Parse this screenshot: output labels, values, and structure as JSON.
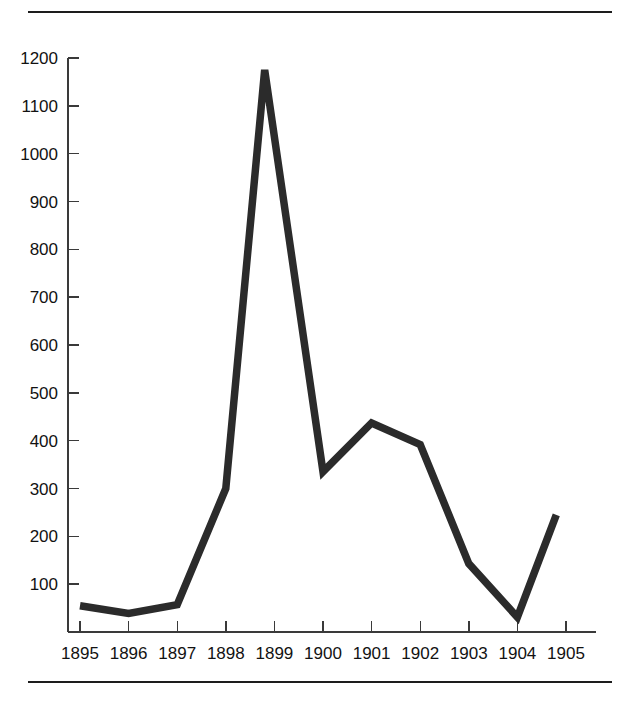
{
  "page": {
    "background_color": "#ffffff",
    "rule_color": "#1d1d1d",
    "top_rule": "horizontal-rule",
    "bottom_rule": "horizontal-rule"
  },
  "chart_data": {
    "type": "line",
    "title": "",
    "subtitle": "",
    "xlabel": "",
    "ylabel": "",
    "categories": [
      "1895",
      "1896",
      "1897",
      "1898",
      "1899",
      "1900",
      "1901",
      "1902",
      "1903",
      "1904",
      "1905"
    ],
    "x": [
      1895,
      1896,
      1897,
      1898,
      1898.8,
      1900,
      1901,
      1902,
      1903,
      1904,
      1904.8
    ],
    "values": [
      55,
      39,
      57,
      300,
      1175,
      335,
      437,
      392,
      143,
      31,
      245
    ],
    "series": [
      {
        "name": "series-1",
        "color": "#2b2b2b",
        "points": [
          {
            "x": 1895,
            "label": "1895",
            "y": 55
          },
          {
            "x": 1896,
            "label": "1896",
            "y": 39
          },
          {
            "x": 1897,
            "label": "1897",
            "y": 57
          },
          {
            "x": 1898,
            "label": "1898",
            "y": 300
          },
          {
            "x": 1898.8,
            "label": "peak",
            "y": 1175
          },
          {
            "x": 1900,
            "label": "1900",
            "y": 335
          },
          {
            "x": 1901,
            "label": "1901",
            "y": 437
          },
          {
            "x": 1902,
            "label": "1902",
            "y": 392
          },
          {
            "x": 1903,
            "label": "1903",
            "y": 143
          },
          {
            "x": 1904,
            "label": "1904",
            "y": 31
          },
          {
            "x": 1904.8,
            "label": "end",
            "y": 245
          }
        ]
      }
    ],
    "xlim": [
      1895,
      1905
    ],
    "ylim": [
      0,
      1200
    ],
    "ytick_values": [
      100,
      200,
      300,
      400,
      500,
      600,
      700,
      800,
      900,
      1000,
      1100,
      1200
    ],
    "ytick_labels": [
      "100",
      "200",
      "300",
      "400",
      "500",
      "600",
      "700",
      "800",
      "900",
      "1000",
      "1100",
      "1200"
    ],
    "xtick_labels": [
      "1895",
      "1896",
      "1897",
      "1898",
      "1899",
      "1900",
      "1901",
      "1902",
      "1903",
      "1904",
      "1905"
    ],
    "grid": false,
    "legend": false,
    "legend_position": "none",
    "annotations": []
  }
}
